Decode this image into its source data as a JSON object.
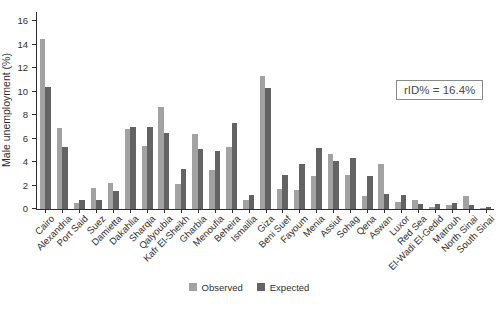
{
  "chart_data": {
    "type": "bar",
    "title": "",
    "xlabel": "",
    "ylabel": "Male unemployment (%)",
    "ylim": [
      0,
      16
    ],
    "yticks": [
      0,
      2,
      4,
      6,
      8,
      10,
      12,
      14,
      16
    ],
    "grid": false,
    "legend_position": "bottom-center",
    "annotation": {
      "text": "rID% = 16.4%"
    },
    "categories": [
      "Cairo",
      "Alexandria",
      "Port Said",
      "Suez",
      "Damietta",
      "Dakahlia",
      "Sharqia",
      "Qalyoubia",
      "Kafr El-Sheikh",
      "Gharbia",
      "Menoufia",
      "Beheira",
      "Ismailia",
      "Giza",
      "Beni Suef",
      "Fayoum",
      "Menia",
      "Assiut",
      "Sohag",
      "Qena",
      "Aswan",
      "Luxor",
      "Red Sea",
      "El-Wadi El-Gedid",
      "Matrouh",
      "North Sinai",
      "South Sinai"
    ],
    "series": [
      {
        "name": "Observed",
        "color": "#a2a2a2",
        "values": [
          14.5,
          6.9,
          0.5,
          1.8,
          2.2,
          6.8,
          5.4,
          8.7,
          2.1,
          6.4,
          3.3,
          5.3,
          0.8,
          11.3,
          1.7,
          1.6,
          2.8,
          4.7,
          2.9,
          1.1,
          3.8,
          0.6,
          0.8,
          0.2,
          0.3,
          1.1,
          0.1
        ]
      },
      {
        "name": "Expected",
        "color": "#636363",
        "values": [
          10.4,
          5.3,
          0.8,
          0.8,
          1.5,
          7.0,
          7.0,
          6.5,
          3.4,
          5.1,
          4.9,
          7.3,
          1.2,
          10.3,
          2.9,
          3.8,
          5.2,
          4.1,
          4.3,
          2.8,
          1.3,
          1.2,
          0.4,
          0.4,
          0.5,
          0.3,
          0.2
        ]
      }
    ]
  },
  "colors": {
    "axis": "#2e2e2e",
    "text": "#3a3a3a",
    "annotation_border": "#8a8a8a",
    "background": "#ffffff"
  }
}
